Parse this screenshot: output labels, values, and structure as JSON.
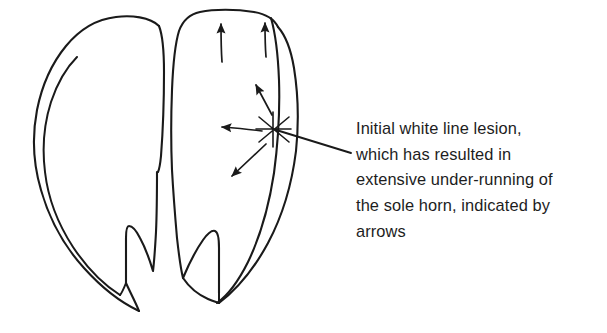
{
  "figure": {
    "name": "bovine-claw-white-line-lesion-diagram",
    "background_color": "#ffffff",
    "ink_color": "#1a1a1a",
    "description_kind": "hand-drawn line diagram of a pair of bovine claws, solar surface view"
  },
  "caption": {
    "full_text": "Initial white line lesion, which has resulted in extensive under-running of the sole horn, indicated by arrows",
    "lines": [
      "Initial white line lesion,",
      "which has resulted in",
      "extensive under-running of",
      "the sole horn, indicated by",
      "arrows"
    ],
    "text_color": "#1d1d1d"
  },
  "annotations": {
    "lesion_marker": {
      "label": "lesion-x-mark",
      "symbol": "X",
      "x": 273,
      "y": 129
    },
    "leader_line": {
      "label": "caption-leader-line",
      "from_x": 273,
      "from_y": 129,
      "to_x": 351,
      "to_y": 153
    },
    "arrows": [
      {
        "label": "arrow-up-left-top",
        "direction": "up",
        "from_x": 222,
        "from_y": 62,
        "to_x": 221,
        "to_y": 14
      },
      {
        "label": "arrow-up-right-top",
        "direction": "up",
        "from_x": 266,
        "from_y": 57,
        "to_x": 265,
        "to_y": 13
      },
      {
        "label": "arrow-up-left-diagonal",
        "direction": "up-left",
        "from_x": 272,
        "from_y": 115,
        "to_x": 252,
        "to_y": 77
      },
      {
        "label": "arrow-left-horizontal",
        "direction": "left",
        "from_x": 262,
        "from_y": 131,
        "to_x": 212,
        "to_y": 127
      },
      {
        "label": "arrow-down-left-diagonal",
        "direction": "down-left",
        "from_x": 266,
        "from_y": 144,
        "to_x": 224,
        "to_y": 183
      }
    ],
    "arrow_count": 5
  },
  "claws": {
    "left": {
      "label": "left-claw",
      "parts": [
        "abaxial-wall",
        "white-line",
        "sole",
        "heel-notch"
      ]
    },
    "right": {
      "label": "right-claw",
      "parts": [
        "abaxial-wall",
        "white-line",
        "sole",
        "heel-notch"
      ]
    },
    "interdigital_cleft": {
      "label": "interdigital-cleft"
    }
  }
}
